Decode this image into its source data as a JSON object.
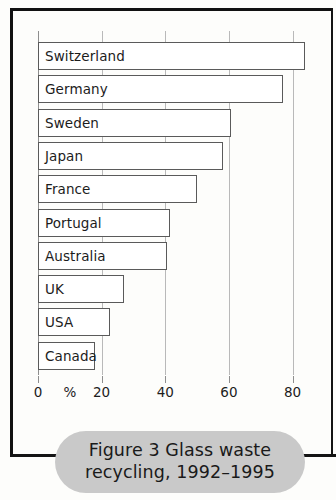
{
  "figure": {
    "caption": "Figure 3 Glass waste recycling, 1992–1995"
  },
  "chart_data": {
    "type": "bar",
    "orientation": "horizontal",
    "title": "Figure 3 Glass waste recycling, 1992–1995",
    "xlabel": "%",
    "ylabel": "",
    "xlim": [
      0,
      88
    ],
    "xticks": [
      0,
      20,
      40,
      60,
      80
    ],
    "xtick_labels": [
      "0",
      "20",
      "40",
      "60",
      "80"
    ],
    "grid": true,
    "legend": null,
    "categories": [
      "Switzerland",
      "Germany",
      "Sweden",
      "Japan",
      "France",
      "Portugal",
      "Australia",
      "UK",
      "USA",
      "Canada"
    ],
    "values": [
      84,
      77,
      60.5,
      58,
      50,
      41.5,
      40.5,
      27,
      22.5,
      18
    ],
    "bars": [
      {
        "label": "Switzerland",
        "value": 84
      },
      {
        "label": "Germany",
        "value": 77
      },
      {
        "label": "Sweden",
        "value": 60.5
      },
      {
        "label": "Japan",
        "value": 58
      },
      {
        "label": "France",
        "value": 50
      },
      {
        "label": "Portugal",
        "value": 41.5
      },
      {
        "label": "Australia",
        "value": 40.5
      },
      {
        "label": "UK",
        "value": 27
      },
      {
        "label": "USA",
        "value": 22.5
      },
      {
        "label": "Canada",
        "value": 18
      }
    ],
    "axis_unit_label": "%",
    "colors": {
      "bar_fill": "#ffffff",
      "bar_stroke": "#5a5a5a",
      "gridline": "#b9b9b9",
      "frame": "#141414",
      "caption_pill": "#c9c9c9",
      "text": "#1c1c1c",
      "background": "#fdfdfb"
    }
  }
}
